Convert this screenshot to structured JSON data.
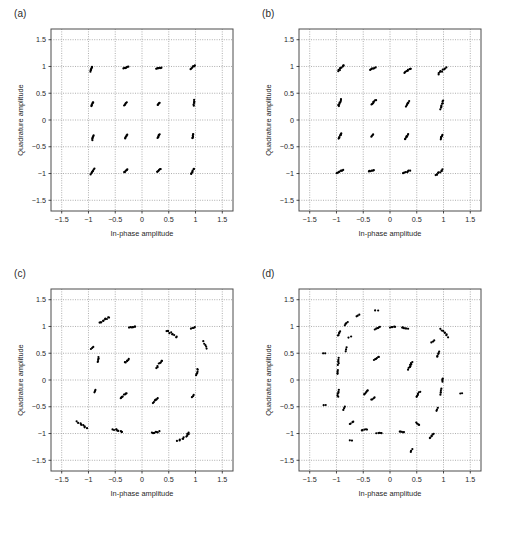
{
  "figure": {
    "background": "#ffffff",
    "ink": "#000000",
    "grid_color": "#8d8d8d",
    "frame_color": "#4d4d4d",
    "width": 512,
    "height": 538
  },
  "axes": {
    "xlabel": "In-phase amplitude",
    "ylabel": "Quadrature amplitude",
    "xticks": [
      "−1.5",
      "−1",
      "−0.5",
      "0",
      "0.5",
      "1",
      "1.5"
    ],
    "yticks": [
      "1.5",
      "1",
      "0.5",
      "0",
      "−0.5",
      "−1",
      "−1.5"
    ],
    "xlim": [
      -1.7,
      1.7
    ],
    "ylim": [
      -1.7,
      1.7
    ],
    "tickvals": [
      -1.5,
      -1,
      -0.5,
      0,
      0.5,
      1,
      1.5
    ],
    "grid": true
  },
  "caption": "",
  "chart_data": [
    {
      "type": "scatter",
      "panel": "(a)",
      "title": "",
      "xlabel": "In-phase amplitude",
      "ylabel": "Quadrature amplitude",
      "xlim": [
        -1.7,
        1.7
      ],
      "ylim": [
        -1.7,
        1.7
      ],
      "marker_size": 1.1,
      "description": "16-QAM constellation, tight clusters on rectangular grid at ±0.3 and ±0.95",
      "clusters": [
        {
          "i": -0.95,
          "q": 0.95,
          "spread": 0.045,
          "angle": 70,
          "n": 7
        },
        {
          "i": -0.3,
          "q": 0.98,
          "spread": 0.045,
          "angle": 25,
          "n": 7
        },
        {
          "i": 0.32,
          "q": 0.97,
          "spread": 0.05,
          "angle": 15,
          "n": 7
        },
        {
          "i": 0.95,
          "q": 0.99,
          "spread": 0.055,
          "angle": 45,
          "n": 7
        },
        {
          "i": -0.93,
          "q": 0.3,
          "spread": 0.04,
          "angle": 65,
          "n": 6
        },
        {
          "i": -0.31,
          "q": 0.3,
          "spread": 0.035,
          "angle": 55,
          "n": 5
        },
        {
          "i": 0.31,
          "q": 0.3,
          "spread": 0.028,
          "angle": 50,
          "n": 5
        },
        {
          "i": 0.97,
          "q": 0.32,
          "spread": 0.05,
          "angle": 80,
          "n": 6
        },
        {
          "i": -0.92,
          "q": -0.33,
          "spread": 0.042,
          "angle": 75,
          "n": 6
        },
        {
          "i": -0.3,
          "q": -0.31,
          "spread": 0.04,
          "angle": 60,
          "n": 6
        },
        {
          "i": 0.31,
          "q": -0.3,
          "spread": 0.04,
          "angle": 60,
          "n": 6
        },
        {
          "i": 0.95,
          "q": -0.3,
          "spread": 0.045,
          "angle": 80,
          "n": 6
        },
        {
          "i": -0.93,
          "q": -0.96,
          "spread": 0.06,
          "angle": 55,
          "n": 7
        },
        {
          "i": -0.3,
          "q": -0.95,
          "spread": 0.045,
          "angle": 40,
          "n": 6
        },
        {
          "i": 0.31,
          "q": -0.94,
          "spread": 0.045,
          "angle": 40,
          "n": 6
        },
        {
          "i": 0.94,
          "q": -0.96,
          "spread": 0.06,
          "angle": 60,
          "n": 7
        }
      ]
    },
    {
      "type": "scatter",
      "panel": "(b)",
      "title": "",
      "xlabel": "In-phase amplitude",
      "ylabel": "Quadrature amplitude",
      "xlim": [
        -1.7,
        1.7
      ],
      "ylim": [
        -1.7,
        1.7
      ],
      "marker_size": 1.1,
      "description": "16-QAM constellation with moderate rotational spreading of outer symbols",
      "clusters": [
        {
          "i": -0.92,
          "q": 0.97,
          "spread": 0.085,
          "angle": 50,
          "n": 9
        },
        {
          "i": -0.32,
          "q": 0.96,
          "spread": 0.05,
          "angle": 20,
          "n": 7
        },
        {
          "i": 0.33,
          "q": 0.93,
          "spread": 0.07,
          "angle": 35,
          "n": 8
        },
        {
          "i": 0.97,
          "q": 0.92,
          "spread": 0.095,
          "angle": 40,
          "n": 9
        },
        {
          "i": -0.94,
          "q": 0.32,
          "spread": 0.065,
          "angle": 70,
          "n": 8
        },
        {
          "i": -0.31,
          "q": 0.33,
          "spread": 0.06,
          "angle": 45,
          "n": 7
        },
        {
          "i": 0.33,
          "q": 0.3,
          "spread": 0.055,
          "angle": 60,
          "n": 7
        },
        {
          "i": 0.97,
          "q": 0.28,
          "spread": 0.08,
          "angle": 75,
          "n": 8
        },
        {
          "i": -0.93,
          "q": -0.3,
          "spread": 0.06,
          "angle": 65,
          "n": 7
        },
        {
          "i": -0.33,
          "q": -0.29,
          "spread": 0.025,
          "angle": 50,
          "n": 4
        },
        {
          "i": 0.31,
          "q": -0.31,
          "spread": 0.06,
          "angle": 60,
          "n": 7
        },
        {
          "i": 0.96,
          "q": -0.32,
          "spread": 0.045,
          "angle": 70,
          "n": 6
        },
        {
          "i": -0.93,
          "q": -0.96,
          "spread": 0.07,
          "angle": 20,
          "n": 8
        },
        {
          "i": -0.35,
          "q": -0.95,
          "spread": 0.05,
          "angle": 15,
          "n": 6
        },
        {
          "i": 0.31,
          "q": -0.97,
          "spread": 0.06,
          "angle": 25,
          "n": 7
        },
        {
          "i": 0.92,
          "q": -0.98,
          "spread": 0.09,
          "angle": 40,
          "n": 9
        }
      ]
    },
    {
      "type": "scatter",
      "panel": "(c)",
      "title": "",
      "xlabel": "In-phase amplitude",
      "ylabel": "Quadrature amplitude",
      "xlim": [
        -1.7,
        1.7
      ],
      "ylim": [
        -1.7,
        1.7
      ],
      "marker_size": 1.1,
      "description": "16-QAM constellation with strong phase rotation; outer symbols smeared along arcs",
      "clusters": [
        {
          "i": -0.7,
          "q": 1.12,
          "spread": 0.11,
          "angle": 35,
          "n": 10
        },
        {
          "i": -0.18,
          "q": 0.99,
          "spread": 0.06,
          "angle": 5,
          "n": 7
        },
        {
          "i": 0.55,
          "q": 0.87,
          "spread": 0.12,
          "angle": -35,
          "n": 10
        },
        {
          "i": 0.95,
          "q": 0.97,
          "spread": 0.035,
          "angle": 20,
          "n": 4
        },
        {
          "i": -0.93,
          "q": 0.6,
          "spread": 0.03,
          "angle": 45,
          "n": 3
        },
        {
          "i": 1.18,
          "q": 0.65,
          "spread": 0.075,
          "angle": -60,
          "n": 5
        },
        {
          "i": -0.82,
          "q": 0.38,
          "spread": 0.045,
          "angle": 80,
          "n": 5
        },
        {
          "i": -0.28,
          "q": 0.36,
          "spread": 0.055,
          "angle": 40,
          "n": 6
        },
        {
          "i": 0.32,
          "q": 0.3,
          "spread": 0.085,
          "angle": 55,
          "n": 8
        },
        {
          "i": 1.03,
          "q": 0.15,
          "spread": 0.065,
          "angle": 80,
          "n": 6
        },
        {
          "i": -0.88,
          "q": -0.21,
          "spread": 0.025,
          "angle": 60,
          "n": 3
        },
        {
          "i": -0.35,
          "q": -0.29,
          "spread": 0.075,
          "angle": 40,
          "n": 8
        },
        {
          "i": 0.25,
          "q": -0.38,
          "spread": 0.06,
          "angle": 45,
          "n": 7
        },
        {
          "i": 0.95,
          "q": -0.3,
          "spread": 0.03,
          "angle": 50,
          "n": 3
        },
        {
          "i": -1.12,
          "q": -0.84,
          "spread": 0.11,
          "angle": -35,
          "n": 9
        },
        {
          "i": -0.45,
          "q": -0.94,
          "spread": 0.09,
          "angle": -15,
          "n": 9
        },
        {
          "i": 0.25,
          "q": -0.98,
          "spread": 0.075,
          "angle": 10,
          "n": 8
        },
        {
          "i": 0.78,
          "q": -1.07,
          "spread": 0.135,
          "angle": 35,
          "n": 11
        }
      ]
    },
    {
      "type": "scatter",
      "panel": "(d)",
      "title": "",
      "xlabel": "In-phase amplitude",
      "ylabel": "Quadrature amplitude",
      "xlim": [
        -1.7,
        1.7
      ],
      "ylim": [
        -1.7,
        1.7
      ],
      "marker_size": 1.1,
      "description": "16-QAM constellation severely distorted; symbols scattered around a ring, inner ring points merged",
      "clusters": [
        {
          "i": -0.25,
          "q": 1.3,
          "spread": 0.025,
          "angle": 0,
          "n": 2
        },
        {
          "i": -0.6,
          "q": 1.2,
          "spread": 0.03,
          "angle": 30,
          "n": 3
        },
        {
          "i": -0.82,
          "q": 1.05,
          "spread": 0.045,
          "angle": 45,
          "n": 4
        },
        {
          "i": -0.95,
          "q": 0.87,
          "spread": 0.05,
          "angle": 60,
          "n": 5
        },
        {
          "i": -0.75,
          "q": 0.8,
          "spread": 0.025,
          "angle": 20,
          "n": 2
        },
        {
          "i": -0.23,
          "q": 0.97,
          "spread": 0.055,
          "angle": 25,
          "n": 6
        },
        {
          "i": 0.05,
          "q": 0.99,
          "spread": 0.045,
          "angle": 10,
          "n": 5
        },
        {
          "i": 0.28,
          "q": 0.97,
          "spread": 0.055,
          "angle": -10,
          "n": 6
        },
        {
          "i": 1.02,
          "q": 0.88,
          "spread": 0.095,
          "angle": -50,
          "n": 8
        },
        {
          "i": 0.8,
          "q": 0.72,
          "spread": 0.03,
          "angle": 40,
          "n": 3
        },
        {
          "i": -0.82,
          "q": 0.57,
          "spread": 0.035,
          "angle": 70,
          "n": 3
        },
        {
          "i": -1.23,
          "q": 0.5,
          "spread": 0.02,
          "angle": 0,
          "n": 2
        },
        {
          "i": -0.96,
          "q": 0.35,
          "spread": 0.06,
          "angle": 85,
          "n": 6
        },
        {
          "i": -0.98,
          "q": 0.15,
          "spread": 0.04,
          "angle": 85,
          "n": 4
        },
        {
          "i": -0.25,
          "q": 0.4,
          "spread": 0.06,
          "angle": 35,
          "n": 6
        },
        {
          "i": 0.38,
          "q": 0.27,
          "spread": 0.075,
          "angle": 65,
          "n": 10
        },
        {
          "i": 0.9,
          "q": 0.48,
          "spread": 0.055,
          "angle": 75,
          "n": 5
        },
        {
          "i": 0.98,
          "q": 0.0,
          "spread": 0.03,
          "angle": 85,
          "n": 4
        },
        {
          "i": -0.97,
          "q": -0.25,
          "spread": 0.06,
          "angle": 85,
          "n": 6
        },
        {
          "i": -1.22,
          "q": -0.47,
          "spread": 0.02,
          "angle": 0,
          "n": 2
        },
        {
          "i": -0.86,
          "q": -0.53,
          "spread": 0.03,
          "angle": 60,
          "n": 3
        },
        {
          "i": -0.45,
          "q": -0.23,
          "spread": 0.055,
          "angle": 45,
          "n": 6
        },
        {
          "i": -0.32,
          "q": -0.35,
          "spread": 0.035,
          "angle": 35,
          "n": 4
        },
        {
          "i": 0.52,
          "q": -0.27,
          "spread": 0.06,
          "angle": 55,
          "n": 6
        },
        {
          "i": 1.33,
          "q": -0.25,
          "spread": 0.02,
          "angle": 0,
          "n": 2
        },
        {
          "i": 0.95,
          "q": -0.22,
          "spread": 0.05,
          "angle": 80,
          "n": 5
        },
        {
          "i": 0.88,
          "q": -0.55,
          "spread": 0.03,
          "angle": 70,
          "n": 3
        },
        {
          "i": -0.72,
          "q": -0.8,
          "spread": 0.045,
          "angle": 30,
          "n": 4
        },
        {
          "i": -0.73,
          "q": -1.13,
          "spread": 0.02,
          "angle": 0,
          "n": 2
        },
        {
          "i": -0.48,
          "q": -0.93,
          "spread": 0.05,
          "angle": 10,
          "n": 5
        },
        {
          "i": -0.2,
          "q": -0.99,
          "spread": 0.05,
          "angle": 5,
          "n": 5
        },
        {
          "i": 0.22,
          "q": -0.97,
          "spread": 0.045,
          "angle": -10,
          "n": 5
        },
        {
          "i": 0.52,
          "q": -0.82,
          "spread": 0.035,
          "angle": -40,
          "n": 4
        },
        {
          "i": 0.4,
          "q": -1.32,
          "spread": 0.03,
          "angle": 60,
          "n": 3
        },
        {
          "i": 0.78,
          "q": -1.05,
          "spread": 0.06,
          "angle": 45,
          "n": 6
        }
      ]
    }
  ]
}
